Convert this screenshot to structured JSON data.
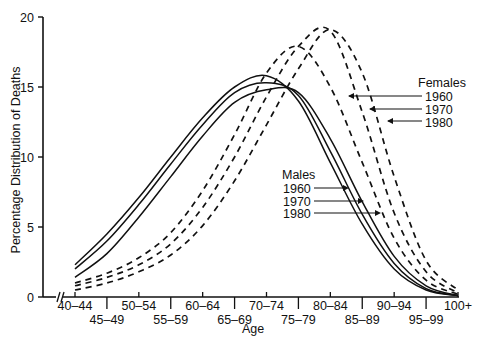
{
  "chart_data": {
    "type": "line",
    "title": "",
    "xlabel": "Age",
    "ylabel": "Percentage Distribution of Deaths",
    "ylim": [
      0,
      20
    ],
    "yticks": [
      0,
      5,
      10,
      15,
      20
    ],
    "grid": false,
    "legend_position": "inline-right",
    "categories": [
      "40-44",
      "45-49",
      "50-54",
      "55-59",
      "60-64",
      "65-69",
      "70-74",
      "75-79",
      "80-84",
      "85-89",
      "90-94",
      "95-99",
      "100+"
    ],
    "x_label_rows": {
      "upper": [
        "40-44",
        "50-54",
        "60-64",
        "70-74",
        "80-84",
        "90-94",
        "100+"
      ],
      "lower": [
        "45-49",
        "55-59",
        "65-69",
        "75-79",
        "85-89",
        "95-99"
      ]
    },
    "legend_groups": [
      {
        "title": "Females",
        "style": "dashed",
        "entries": [
          "1960",
          "1970",
          "1980"
        ]
      },
      {
        "title": "Males",
        "style": "solid",
        "entries": [
          "1960",
          "1970",
          "1980"
        ]
      }
    ],
    "series": [
      {
        "name": "Males 1960",
        "sex": "Males",
        "year": "1960",
        "style": "solid",
        "values": [
          2.3,
          4.5,
          7.1,
          10.0,
          12.8,
          15.0,
          15.8,
          14.0,
          9.6,
          5.2,
          2.0,
          0.5,
          0.1
        ]
      },
      {
        "name": "Males 1970",
        "sex": "Males",
        "year": "1970",
        "style": "solid",
        "values": [
          2.0,
          4.0,
          6.6,
          9.5,
          12.3,
          14.6,
          15.3,
          14.4,
          10.4,
          5.9,
          2.4,
          0.6,
          0.1
        ]
      },
      {
        "name": "Males 1980",
        "sex": "Males",
        "year": "1980",
        "style": "solid",
        "values": [
          1.4,
          3.1,
          5.7,
          8.6,
          11.5,
          13.9,
          14.8,
          14.6,
          11.3,
          6.8,
          2.9,
          0.8,
          0.1
        ]
      },
      {
        "name": "Females 1960",
        "sex": "Females",
        "year": "1960",
        "style": "dashed",
        "values": [
          1.0,
          1.7,
          2.8,
          4.6,
          7.6,
          11.6,
          16.0,
          17.9,
          15.0,
          9.6,
          4.2,
          1.2,
          0.2
        ]
      },
      {
        "name": "Females 1970",
        "sex": "Females",
        "year": "1970",
        "style": "dashed",
        "values": [
          0.8,
          1.4,
          2.3,
          3.8,
          6.4,
          10.0,
          14.3,
          17.9,
          19.0,
          13.2,
          6.0,
          1.8,
          0.3
        ]
      },
      {
        "name": "Females 1980",
        "sex": "Females",
        "year": "1980",
        "style": "dashed",
        "values": [
          0.5,
          1.0,
          1.8,
          3.0,
          5.1,
          8.3,
          12.3,
          16.3,
          19.1,
          16.0,
          8.6,
          2.6,
          0.5
        ]
      }
    ]
  },
  "labels": {
    "ylabel": "Percentage Distribution of Deaths",
    "xlabel": "Age",
    "females_title": "Females",
    "males_title": "Males",
    "year_1960": "1960",
    "year_1970": "1970",
    "year_1980": "1980"
  }
}
